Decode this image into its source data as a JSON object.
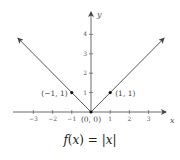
{
  "chart_data": {
    "type": "line",
    "title": "f(x) = |x|",
    "xlabel": "x",
    "ylabel": "y",
    "xlim": [
      -4,
      4
    ],
    "ylim": [
      0,
      4.5
    ],
    "x_ticks": [
      -3,
      -2,
      -1,
      1,
      2,
      3
    ],
    "y_ticks": [
      1,
      2,
      3,
      4
    ],
    "grid": false,
    "series": [
      {
        "name": "f(x) = |x|",
        "x": [
          -3.8,
          0,
          3.8
        ],
        "y": [
          3.8,
          0,
          3.8
        ]
      }
    ],
    "points": [
      {
        "x": -1,
        "y": 1,
        "label": "(−1, 1)"
      },
      {
        "x": 0,
        "y": 0,
        "label": "(0, 0)"
      },
      {
        "x": 1,
        "y": 1,
        "label": "(1, 1)"
      }
    ]
  },
  "caption": {
    "func": "f",
    "var": "x",
    "text": "f(x) = |x|"
  }
}
